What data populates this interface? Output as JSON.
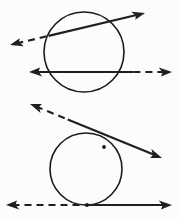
{
  "figure": {
    "width": 179,
    "height": 219,
    "background_color": "#fcfcfc",
    "stroke_color": "#1f1f1f",
    "circle_stroke_color": "#1a1a1a",
    "panels": [
      {
        "name": "upper-panel",
        "label": "Secant lines crossing a circle",
        "circle": {
          "cx": 84,
          "cy": 52,
          "r": 40
        },
        "lines": [
          {
            "name": "upper-diagonal-secant-line",
            "style": "dashed-left-solid-right",
            "x1": 10,
            "y1": 45,
            "x2": 145,
            "y2": 13,
            "dash_end_fraction": 0.3,
            "arrow_start": true,
            "arrow_end": true
          },
          {
            "name": "upper-horizontal-secant-line",
            "style": "solid-left-dashed-right",
            "x1": 29,
            "y1": 72,
            "x2": 172,
            "y2": 72,
            "solid_end_fraction": 0.73,
            "arrow_start": true,
            "arrow_end": true
          }
        ]
      },
      {
        "name": "lower-panel",
        "label": "Tangent lines touching a circle",
        "circle": {
          "cx": 86,
          "cy": 169,
          "r": 36
        },
        "lines": [
          {
            "name": "lower-diagonal-tangent-line",
            "style": "dashed-left-solid-right",
            "x1": 30,
            "y1": 104,
            "x2": 162,
            "y2": 158,
            "dash_end_fraction": 0.3,
            "arrow_start": true,
            "arrow_end": true
          },
          {
            "name": "lower-horizontal-tangent-line",
            "style": "dashed-left-solid-right",
            "x1": 6,
            "y1": 205,
            "x2": 172,
            "y2": 205,
            "dash_end_fraction": 0.49,
            "arrow_start": true,
            "arrow_end": true
          }
        ],
        "tangent_points": [
          {
            "name": "diagonal-tangent-point",
            "x": 104,
            "y": 147
          },
          {
            "name": "horizontal-tangent-point",
            "x": 87,
            "y": 205
          }
        ]
      }
    ]
  }
}
